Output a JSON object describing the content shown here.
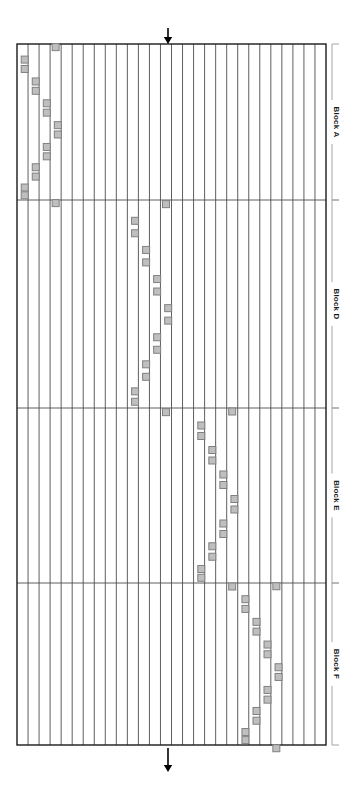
{
  "figure": {
    "background_color": "#ffffff",
    "line_color": "#4d4d4d",
    "frame_color": "#1a1a1a",
    "marker_fill": "#bfbfbf",
    "marker_stroke": "#808080",
    "arrow_color": "#000000",
    "grid": {
      "left": 17,
      "right": 326,
      "top": 44,
      "bottom": 745,
      "column_count": 28,
      "row_count": 4
    },
    "arrows": [
      {
        "name": "top-arrow",
        "x": 168,
        "y_start": 28,
        "y_end": 44,
        "direction": "down"
      },
      {
        "name": "bottom-arrow",
        "x": 168,
        "y_start": 748,
        "y_end": 772,
        "direction": "down"
      }
    ],
    "blocks": [
      {
        "label": "Block A",
        "top": 44,
        "bottom": 200,
        "offset_columns": 0
      },
      {
        "label": "Block D",
        "top": 200,
        "bottom": 408,
        "offset_columns": 10
      },
      {
        "label": "Block E",
        "top": 408,
        "bottom": 583,
        "offset_columns": 16
      },
      {
        "label": "Block F",
        "top": 583,
        "bottom": 745,
        "offset_columns": 20
      }
    ],
    "marker_size": 7,
    "marker_pattern": [
      {
        "col": 3.0,
        "t": 0.02
      },
      {
        "col": 0.2,
        "t": 0.1
      },
      {
        "col": 0.2,
        "t": 0.16
      },
      {
        "col": 1.2,
        "t": 0.24
      },
      {
        "col": 1.2,
        "t": 0.3
      },
      {
        "col": 2.2,
        "t": 0.38
      },
      {
        "col": 2.2,
        "t": 0.44
      },
      {
        "col": 3.2,
        "t": 0.52
      },
      {
        "col": 3.2,
        "t": 0.58
      },
      {
        "col": 2.2,
        "t": 0.66
      },
      {
        "col": 2.2,
        "t": 0.72
      },
      {
        "col": 1.2,
        "t": 0.79
      },
      {
        "col": 1.2,
        "t": 0.85
      },
      {
        "col": 0.2,
        "t": 0.92
      },
      {
        "col": 0.2,
        "t": 0.97
      },
      {
        "col": 3.0,
        "t": 1.02
      }
    ]
  }
}
